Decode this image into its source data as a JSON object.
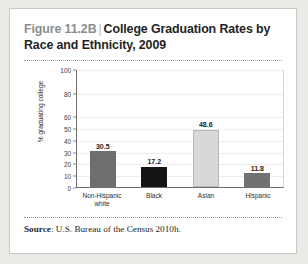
{
  "figure": {
    "number_label": "Figure 11.2B",
    "separator": "|",
    "title": "College Graduation Rates by Race and Ethnicity, 2009"
  },
  "source": {
    "label": "Source",
    "colon": ":",
    "text": "U.S. Bureau of the Census 2010h."
  },
  "colors": {
    "non_hispanic_white": "#6e6e6e",
    "black": "#141414",
    "asian": "#d8d8d8",
    "hispanic": "#727272",
    "axis": "#6f6f6f",
    "grid": "#ededed",
    "card_bg": "#ffffff",
    "page_bg": "#eceae6"
  },
  "chart_data": {
    "type": "bar",
    "title": "College Graduation Rates by Race and Ethnicity, 2009",
    "xlabel": "",
    "ylabel": "% graduating college",
    "categories": [
      "Non-Hispanic white",
      "Black",
      "Asian",
      "Hispanic"
    ],
    "category_lines": [
      [
        "Non-Hispanic",
        "white"
      ],
      [
        "Black"
      ],
      [
        "Asian"
      ],
      [
        "Hispanic"
      ]
    ],
    "values": [
      30.5,
      17.2,
      48.6,
      11.8
    ],
    "value_labels": [
      "30.5",
      "17.2",
      "48.6",
      "11.8"
    ],
    "bar_colors": [
      "#6e6e6e",
      "#141414",
      "#d8d8d8",
      "#727272"
    ],
    "ylim": [
      0,
      100
    ],
    "yticks": [
      0,
      10,
      20,
      30,
      40,
      50,
      60,
      80,
      100
    ],
    "ytick_labels": [
      "0",
      "10",
      "20",
      "30",
      "40",
      "50",
      "60",
      "80",
      "100"
    ],
    "grid": true,
    "legend": null
  }
}
